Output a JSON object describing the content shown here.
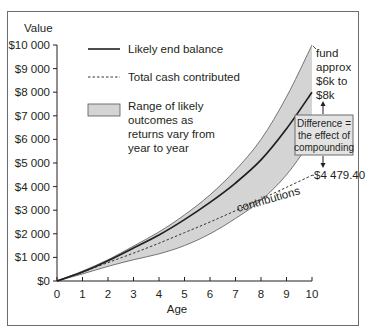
{
  "chart_data": {
    "type": "area",
    "title": "",
    "xlabel": "Age",
    "ylabel": "Value",
    "xlim": [
      0,
      10
    ],
    "ylim": [
      0,
      10000
    ],
    "grid": false,
    "legend_position": "upper-left inside",
    "x": [
      0,
      1,
      2,
      3,
      4,
      5,
      6,
      7,
      8,
      9,
      10
    ],
    "x_tick_labels": [
      "0",
      "1",
      "2",
      "3",
      "4",
      "5",
      "6",
      "7",
      "8",
      "9",
      "10"
    ],
    "y_ticks": [
      0,
      1000,
      2000,
      3000,
      4000,
      5000,
      6000,
      7000,
      8000,
      9000,
      10000
    ],
    "y_tick_labels": [
      "$0",
      "$1 000",
      "$2 000",
      "$3 000",
      "$4 000",
      "$5 000",
      "$6 000",
      "$7 000",
      "$8 000",
      "$9 000",
      "$10 000"
    ],
    "series": [
      {
        "name": "Likely end balance",
        "style": "solid",
        "values": [
          0,
          380,
          860,
          1400,
          1950,
          2600,
          3330,
          4150,
          5130,
          6450,
          8000
        ]
      },
      {
        "name": "Total cash contributed",
        "style": "dashed",
        "values": [
          0,
          380,
          780,
          1180,
          1600,
          2050,
          2500,
          2980,
          3470,
          3970,
          4479.4
        ]
      },
      {
        "name": "Range of likely outcomes (upper)",
        "style": "band-upper",
        "values": [
          0,
          420,
          900,
          1480,
          2080,
          2800,
          3650,
          4700,
          6000,
          7800,
          10000
        ]
      },
      {
        "name": "Range of likely outcomes (lower)",
        "style": "band-lower",
        "values": [
          0,
          300,
          620,
          900,
          1150,
          1500,
          2000,
          2650,
          3420,
          4500,
          6000
        ]
      }
    ],
    "legend": [
      {
        "label": "Likely end balance",
        "swatch": "solid-line"
      },
      {
        "label": "Total cash contributed",
        "swatch": "dashed-line"
      },
      {
        "label_lines": [
          "Range of likely",
          "outcomes as",
          "returns vary from",
          "year to year"
        ],
        "swatch": "gray-box"
      }
    ],
    "annotations": {
      "fund_range": [
        "fund",
        "approx",
        "$6k to",
        "$8k"
      ],
      "difference_box": [
        "Difference =",
        "the effect of",
        "compounding"
      ],
      "end_contribution": "$4 479.40",
      "contributions_label": "contributions"
    },
    "colors": {
      "band_fill": "#d4d4d4",
      "band_edge": "#555555",
      "line": "#231f20",
      "box_fill": "#e3e3e3",
      "frame": "#6d6d6d"
    }
  }
}
